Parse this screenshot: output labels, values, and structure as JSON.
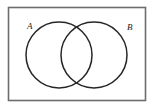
{
  "diagram": {
    "type": "venn-two-set",
    "title": "",
    "universe": {
      "name": "universal-set-rectangle",
      "label": "",
      "x": 8.5,
      "y": 7.5,
      "width": 137,
      "height": 93,
      "stroke_color": "#6d6d6d",
      "stroke_width": 1.6,
      "fill_color": "#ffffff"
    },
    "background_color": "#ffffff",
    "sets": [
      {
        "id": "set-a",
        "label": "A",
        "label_x": 27,
        "label_y": 22,
        "circle": {
          "cx": 59,
          "cy": 55,
          "r": 33
        },
        "stroke_color": "#262626",
        "stroke_width": 1.5,
        "fill": "none"
      },
      {
        "id": "set-b",
        "label": "B",
        "label_x": 127,
        "label_y": 23,
        "circle": {
          "cx": 94,
          "cy": 55,
          "r": 33
        },
        "stroke_color": "#262626",
        "stroke_width": 1.5,
        "fill": "none"
      }
    ],
    "intersection": {
      "name": "a-intersect-b",
      "label": "",
      "shaded": false,
      "top_crossing": {
        "x": 76.5,
        "y": 29
      },
      "bottom_crossing": {
        "x": 76.5,
        "y": 81
      }
    },
    "colors": {
      "ink": "#262626",
      "frame": "#6d6d6d",
      "paper": "#ffffff"
    }
  }
}
